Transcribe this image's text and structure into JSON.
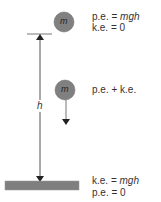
{
  "diagram": {
    "mass_label": "m",
    "height_label": "h",
    "top": {
      "line1": {
        "prefix": "p.e. = ",
        "italic": "mgh"
      },
      "line2": "k.e. = 0"
    },
    "middle": {
      "line1": "p.e. + k.e."
    },
    "bottom": {
      "line1": {
        "prefix": "k.e. = ",
        "italic": "mgh"
      },
      "line2": "p.e. = 0"
    },
    "colors": {
      "ball": "#808080",
      "ball_stroke": "#5a5a5a",
      "ground": "#7f7f7f",
      "line": "#555555",
      "text": "#333333"
    }
  }
}
